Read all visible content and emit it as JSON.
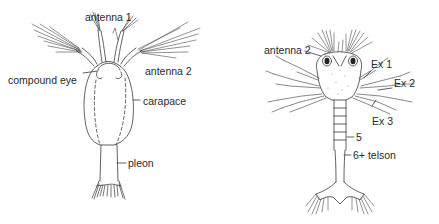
{
  "figure": {
    "left_specimen": {
      "name": "nauplius-like larva (dorsal view)",
      "labels": {
        "antenna1": "antenna 1",
        "antenna2": "antenna 2",
        "compound_eye": "compound eye",
        "carapace": "carapace",
        "pleon": "pleon"
      }
    },
    "right_specimen": {
      "name": "zoea-like larva (dorsal view)",
      "labels": {
        "antenna2": "antenna 2",
        "ex1": "Ex 1",
        "ex2": "Ex 2",
        "ex3": "Ex 3",
        "seg5": "5",
        "seg6_telson": "6+ telson"
      }
    },
    "colors": {
      "line": "#3a3a3a",
      "text": "#2a2a2a",
      "background": "#ffffff"
    }
  }
}
